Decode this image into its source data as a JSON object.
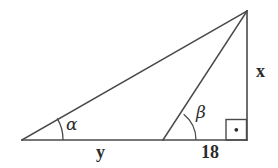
{
  "figure": {
    "type": "geometry-diagram",
    "background_color": "#ffffff",
    "stroke_color": "#4a4a4a",
    "text_color": "#2b2b2b",
    "labels": {
      "alpha": "α",
      "beta": "β",
      "side_x": "x",
      "side_y": "y",
      "side_18": "18"
    },
    "vertices": {
      "left_base": [
        22,
        140
      ],
      "mid_base": [
        163,
        140
      ],
      "right_base": [
        247,
        140
      ],
      "apex": [
        247,
        11
      ]
    },
    "segments": [
      {
        "name": "baseline",
        "from": [
          22,
          140
        ],
        "to": [
          247,
          140
        ]
      },
      {
        "name": "hypotenuse-long",
        "from": [
          22,
          140
        ],
        "to": [
          247,
          11
        ]
      },
      {
        "name": "cevian",
        "from": [
          163,
          140
        ],
        "to": [
          247,
          11
        ]
      },
      {
        "name": "vertical-leg",
        "from": [
          247,
          140
        ],
        "to": [
          247,
          11
        ]
      }
    ],
    "angle_marks": [
      {
        "name": "alpha-arc",
        "at": [
          22,
          140
        ],
        "radius": 41
      },
      {
        "name": "beta-arc",
        "at": [
          163,
          140
        ],
        "radius": 33
      },
      {
        "name": "right-angle-square",
        "at": [
          247,
          140
        ],
        "size": 21,
        "has_center_dot": true
      }
    ]
  }
}
